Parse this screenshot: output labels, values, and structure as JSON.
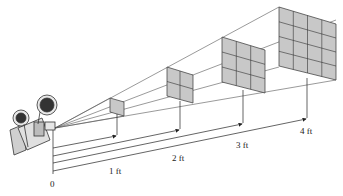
{
  "diagram": {
    "origin_label": "0",
    "distances": [
      {
        "label": "1 ft",
        "grid": 1
      },
      {
        "label": "2 ft",
        "grid": 2
      },
      {
        "label": "3 ft",
        "grid": 3
      },
      {
        "label": "4 ft",
        "grid": 4
      }
    ],
    "colors": {
      "square_fill": "#c8c8c8",
      "line": "#333333",
      "projector": "#d8d8d8"
    }
  }
}
